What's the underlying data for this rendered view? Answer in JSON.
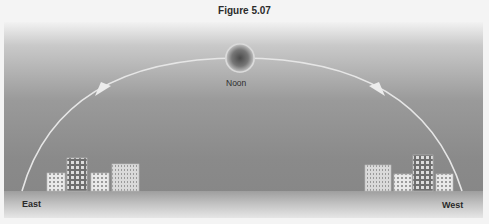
{
  "figure": {
    "title": "Figure 5.07",
    "sun_label": "Noon",
    "east_label": "East",
    "west_label": "West"
  },
  "colors": {
    "sky_top": "#f2f2f2",
    "sky_bottom": "#858585",
    "ground": "#c4c4c4",
    "arc": "#e8e8e8",
    "sun_core": "#5a5a5a",
    "sun_ring": "#e0e0e0"
  },
  "elements": {
    "arc": "sun-path-arc",
    "arrows": [
      "arrow-rising",
      "arrow-setting"
    ],
    "buildings_east": 4,
    "buildings_west": 4
  }
}
